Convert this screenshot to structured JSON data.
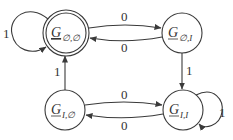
{
  "diagram": {
    "type": "state-machine",
    "nodes": [
      {
        "id": "g_empty_empty",
        "label": "G",
        "subscript": "∅,∅",
        "accepting": true,
        "initial": false
      },
      {
        "id": "g_empty_I",
        "label": "G",
        "subscript": "∅,I",
        "accepting": false
      },
      {
        "id": "g_I_empty",
        "label": "G",
        "subscript": "I,∅",
        "accepting": false
      },
      {
        "id": "g_I_I",
        "label": "G",
        "subscript": "I,I",
        "accepting": false
      }
    ],
    "edges": [
      {
        "from": "g_empty_empty",
        "to": "g_empty_empty",
        "label": "1"
      },
      {
        "from": "g_empty_empty",
        "to": "g_empty_I",
        "label": "0"
      },
      {
        "from": "g_empty_I",
        "to": "g_empty_empty",
        "label": "0"
      },
      {
        "from": "g_empty_I",
        "to": "g_I_I",
        "label": "1"
      },
      {
        "from": "g_I_empty",
        "to": "g_empty_empty",
        "label": "1"
      },
      {
        "from": "g_I_empty",
        "to": "g_I_I",
        "label": "0"
      },
      {
        "from": "g_I_I",
        "to": "g_I_empty",
        "label": "0"
      },
      {
        "from": "g_I_I",
        "to": "g_I_I",
        "label": "1"
      }
    ]
  }
}
